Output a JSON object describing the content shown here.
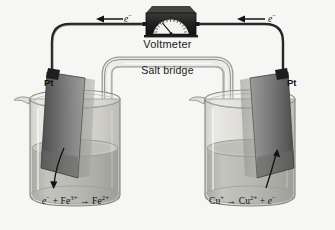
{
  "figure": {
    "background_color": "#f6f6f4"
  },
  "voltmeter": {
    "label": "Voltmeter",
    "body_color": "#2b2b2b",
    "dial_color": "#f2f1ec",
    "needle_color": "#1b1b1b",
    "tick_count": 17
  },
  "salt_bridge": {
    "label": "Salt bridge",
    "tube_color": "#e8e8e4",
    "outline_color": "#9a9a96"
  },
  "wire": {
    "color": "#262626",
    "electron_label_left": "e",
    "electron_label_right": "e",
    "electron_charge": "−",
    "arrow_direction_left": "left",
    "arrow_direction_right": "left"
  },
  "electrodes": {
    "left": {
      "label": "Pt",
      "material": "platinum",
      "plate_color": "#6e6e6e",
      "tilt": "left"
    },
    "right": {
      "label": "Pt",
      "material": "platinum",
      "plate_color": "#6e6e6e",
      "tilt": "right"
    }
  },
  "beakers": {
    "left": {
      "glass_color": "#dcdcd8",
      "solution_color": "#b9b9b4",
      "reaction": {
        "electron": "e",
        "electron_charge": "−",
        "plus": "+",
        "reactant": "Fe",
        "reactant_charge": "3+",
        "arrow": "→",
        "product": "Fe",
        "product_charge": "2+",
        "type": "reduction",
        "arrow_direction": "down"
      }
    },
    "right": {
      "glass_color": "#dcdcd8",
      "solution_color": "#b9b9b4",
      "reaction": {
        "reactant": "Cu",
        "reactant_charge": "+",
        "arrow": "→",
        "product": "Cu",
        "product_charge": "2+",
        "plus": "+",
        "electron": "e",
        "electron_charge": "−",
        "type": "oxidation",
        "arrow_direction": "up"
      }
    }
  }
}
